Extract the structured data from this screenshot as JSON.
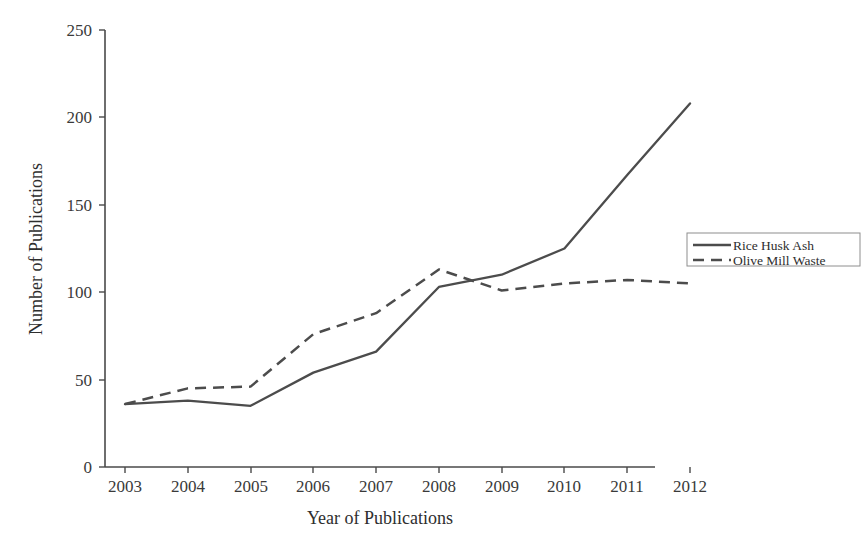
{
  "chart_data": {
    "type": "line",
    "title": "",
    "xlabel": "Year of Publications",
    "ylabel": "Number of Publications",
    "categories": [
      "2003",
      "2004",
      "2005",
      "2006",
      "2007",
      "2008",
      "2009",
      "2010",
      "2011",
      "2012"
    ],
    "x": [
      2003,
      2004,
      2005,
      2006,
      2007,
      2008,
      2009,
      2010,
      2011,
      2012
    ],
    "series": [
      {
        "name": "Rice Husk Ash",
        "style": "solid",
        "color": "#4c4c4c",
        "values": [
          36,
          38,
          35,
          54,
          66,
          103,
          110,
          125,
          167,
          208
        ]
      },
      {
        "name": "Olive Mill Waste",
        "style": "dashed",
        "color": "#4c4c4c",
        "values": [
          36,
          45,
          46,
          76,
          88,
          113,
          101,
          105,
          107,
          105
        ]
      }
    ],
    "ylim": [
      0,
      250
    ],
    "yticks": [
      0,
      50,
      100,
      150,
      200,
      250
    ],
    "ytick_labels": [
      "0",
      "50",
      "100",
      "150",
      "200",
      "250"
    ],
    "grid": false,
    "legend_position": "right"
  },
  "legend": {
    "entries": [
      {
        "label": "Rice Husk Ash",
        "style": "solid"
      },
      {
        "label": "Olive Mill Waste",
        "style": "dashed"
      }
    ]
  }
}
